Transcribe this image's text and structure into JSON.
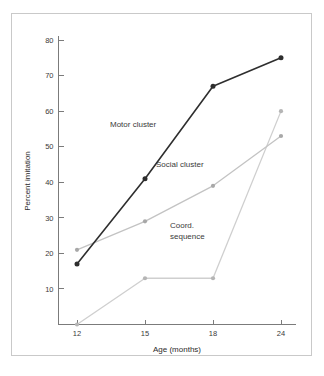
{
  "chart_data": {
    "type": "line",
    "title": "",
    "xlabel": "Age (months)",
    "ylabel": "Percent imitation",
    "categories": [
      "12",
      "15",
      "18",
      "24"
    ],
    "x_tick_labels": [
      "12",
      "15",
      "18",
      "24"
    ],
    "y_tick_labels": [
      "10",
      "20",
      "30",
      "40",
      "50",
      "60",
      "70",
      "80"
    ],
    "y_tick_values": [
      10,
      20,
      30,
      40,
      50,
      60,
      70,
      80
    ],
    "ylim": [
      0,
      80
    ],
    "grid": false,
    "legend_position": "inline-annotations",
    "series": [
      {
        "name": "Motor cluster",
        "values": [
          17,
          41,
          67,
          75
        ],
        "color": "#2e2e2e",
        "marker_color": "#2e2e2e",
        "marker": "circle"
      },
      {
        "name": "Social cluster",
        "values": [
          21,
          29,
          39,
          53
        ],
        "color": "#c3c3c3",
        "marker_color": "#a8a8a8",
        "marker": "circle"
      },
      {
        "name": "Coord. sequence",
        "values": [
          0,
          13,
          13,
          60
        ],
        "color": "#cfcfcf",
        "marker_color": "#b5b5b5",
        "marker": "circle"
      }
    ],
    "annotations": [
      {
        "text": "Motor cluster",
        "lines": [
          "Motor cluster"
        ],
        "x": 110,
        "y": 127
      },
      {
        "text": "Social cluster",
        "lines": [
          "Social cluster"
        ],
        "x": 156,
        "y": 167
      },
      {
        "text": "Coord. sequence",
        "lines": [
          "Coord.",
          "sequence"
        ],
        "x": 170,
        "y": 228
      }
    ]
  },
  "figure": {
    "border_color": "#c9c9c9",
    "axis_color": "#7b7b7b",
    "background": "#ffffff"
  }
}
